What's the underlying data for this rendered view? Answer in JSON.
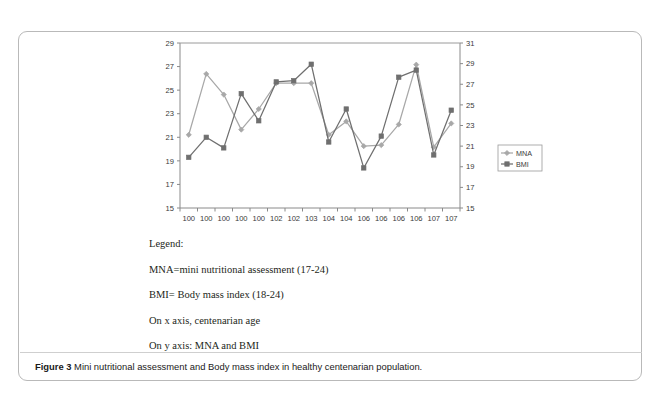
{
  "figure": {
    "caption_label": "Figure 3",
    "caption_text": "Mini nutritional assessment and Body mass index in healthy centenarian population."
  },
  "legend_block": {
    "heading": "Legend:",
    "lines": [
      "MNA=mini nutritional assessment (17-24)",
      "BMI= Body mass index (18-24)",
      "On x axis, centenarian age",
      "On y axis: MNA and BMI"
    ]
  },
  "chart_data": {
    "type": "line",
    "title": "",
    "xlabel": "",
    "ylabel": "",
    "grid": false,
    "legend_position": "right",
    "categories": [
      "100",
      "100",
      "100",
      "100",
      "100",
      "102",
      "102",
      "103",
      "104",
      "104",
      "106",
      "106",
      "106",
      "106",
      "107",
      "107"
    ],
    "left_axis": {
      "label": "",
      "ylim": [
        15,
        29
      ],
      "ticks": [
        15,
        17,
        19,
        21,
        23,
        25,
        27,
        29
      ]
    },
    "right_axis": {
      "label": "",
      "ylim": [
        15,
        31
      ],
      "ticks": [
        15,
        17,
        19,
        21,
        23,
        25,
        27,
        29,
        31
      ]
    },
    "series": [
      {
        "name": "MNA",
        "axis": "right",
        "color": "#a8a8a8",
        "marker": "diamond",
        "values": [
          22.1,
          28.0,
          26.0,
          22.6,
          24.6,
          27.1,
          27.1,
          27.1,
          22.1,
          23.4,
          21.0,
          21.1,
          23.1,
          28.9,
          20.9,
          23.2
        ]
      },
      {
        "name": "BMI",
        "axis": "left",
        "color": "#6f6f6f",
        "marker": "square",
        "values": [
          19.3,
          21.0,
          20.1,
          24.7,
          22.4,
          25.7,
          25.8,
          27.2,
          20.6,
          23.4,
          18.4,
          21.1,
          26.1,
          26.7,
          19.5,
          23.3
        ]
      }
    ]
  }
}
